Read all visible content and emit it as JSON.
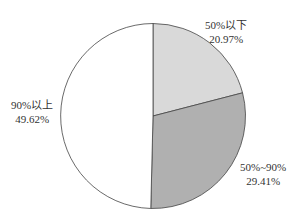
{
  "chart_data": {
    "type": "pie",
    "title": "",
    "categories": [
      "50%以下",
      "50%~90%",
      "90%以上"
    ],
    "values": [
      20.97,
      29.41,
      49.62
    ],
    "value_labels": [
      "20.97%",
      "29.41%",
      "49.62%"
    ],
    "colors": [
      "#d9d9d9",
      "#b0b0b0",
      "#ffffff"
    ],
    "start_angle_deg": 0,
    "direction": "clockwise",
    "legend": "none",
    "outline_color": "#444444"
  },
  "labels": [
    {
      "name": "50%以下",
      "value": "20.97%"
    },
    {
      "name": "50%~90%",
      "value": "29.41%"
    },
    {
      "name": "90%以上",
      "value": "49.62%"
    }
  ]
}
